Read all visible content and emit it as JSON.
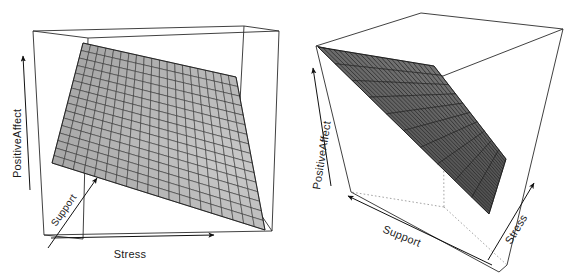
{
  "figure": {
    "title": "",
    "background_color": "#ffffff",
    "panel_count": 2,
    "width": 571,
    "height": 273
  },
  "panels": [
    {
      "id": "left",
      "name": "panel-left",
      "axes": {
        "x": {
          "label": "Stress",
          "arrow": true,
          "direction": "right"
        },
        "y": {
          "label": "Support",
          "arrow": true,
          "direction": "up-right-depth"
        },
        "z": {
          "label": "PositiveAffect",
          "arrow": true,
          "direction": "up"
        }
      },
      "surface": {
        "style": "wireframe-shaded-plane",
        "columns": 20,
        "rows": 16,
        "shading_min": "#9d9d9d",
        "shading_max": "#c9c9c9",
        "mesh_color": "#2a2a2a"
      },
      "box": {
        "visible": true,
        "hidden_edges_dotted": false
      }
    },
    {
      "id": "right",
      "name": "panel-right",
      "axes": {
        "x": {
          "label": "Support",
          "arrow": true,
          "direction": "down-left"
        },
        "y": {
          "label": "Stress",
          "arrow": true,
          "direction": "up-right"
        },
        "z": {
          "label": "PositiveAffect",
          "arrow": true,
          "direction": "up"
        }
      },
      "surface": {
        "style": "wireframe-shaded-plane",
        "columns": 22,
        "rows": 10,
        "shading_min": "#3a3a3a",
        "shading_max": "#777777",
        "mesh_color": "#141414"
      },
      "box": {
        "visible": true,
        "hidden_edges_dotted": true
      }
    }
  ],
  "chart_data": {
    "type": "surface",
    "title": "",
    "subtitle": "",
    "variables": {
      "x": "Stress",
      "y": "Support",
      "z": "PositiveAffect"
    },
    "xlabel": "Stress",
    "ylabel": "Support",
    "zlabel": "PositiveAffect",
    "grid": true,
    "legend": "none",
    "axis_ticks": "none",
    "axis_arrows": true,
    "panels": [
      {
        "name": "view-1",
        "view": "front-left, surface tilted downward toward high Stress",
        "mesh_columns": 20,
        "mesh_rows": 16,
        "surface_shape": "planar, negative slope along Stress, positive slope along Support",
        "corners_z": {
          "low_stress_low_support": 0.62,
          "low_stress_high_support": 0.95,
          "high_stress_low_support": 0.05,
          "high_stress_high_support": 0.55
        }
      },
      {
        "name": "view-2",
        "view": "rotated, surface seen nearly edge-on from above-left",
        "mesh_columns": 22,
        "mesh_rows": 10,
        "surface_shape": "planar, descending from high Support/low Stress to low Support/high Stress",
        "corners_z": {
          "low_stress_low_support": 0.55,
          "low_stress_high_support": 0.92,
          "high_stress_low_support": 0.1,
          "high_stress_high_support": 0.4
        }
      }
    ]
  }
}
